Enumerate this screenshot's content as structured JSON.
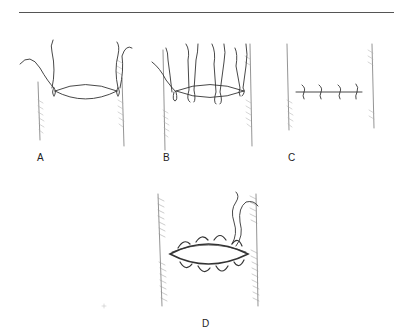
{
  "figure": {
    "panels": [
      {
        "id": "A",
        "label": "A",
        "description": "Vessel with two stay sutures at corners of opening"
      },
      {
        "id": "B",
        "label": "B",
        "description": "Vessel with multiple interrupted sutures placed around opening"
      },
      {
        "id": "C",
        "label": "C",
        "description": "Closed incision with interrupted sutures tied"
      },
      {
        "id": "D",
        "label": "D",
        "description": "Continuous running suture around opening"
      }
    ]
  }
}
